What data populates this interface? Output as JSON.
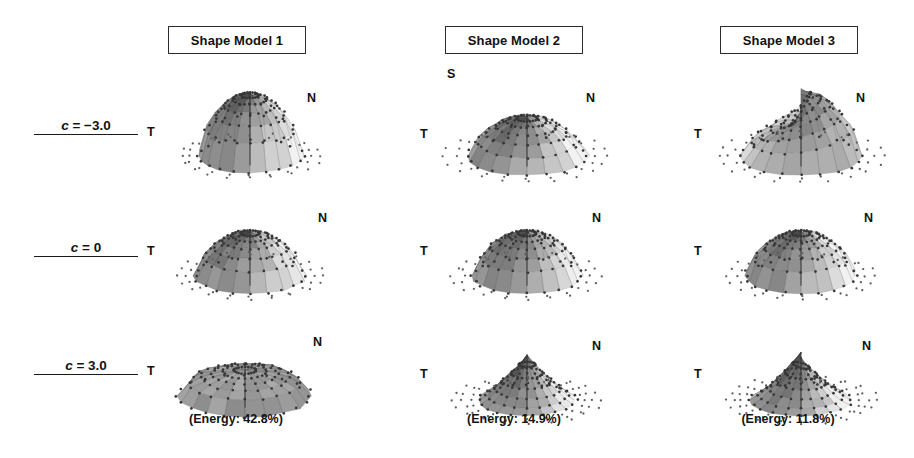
{
  "figure": {
    "background_color": "#ffffff",
    "ink_color": "#121212"
  },
  "columns": [
    {
      "header": "Shape Model 1",
      "energy": "(Energy: 42.8%)",
      "energy_value": 42.8
    },
    {
      "header": "Shape Model 2",
      "energy": "(Energy: 14.9%)",
      "energy_value": 14.9
    },
    {
      "header": "Shape Model 3",
      "energy": "(Energy: 11.8%)",
      "energy_value": 11.8
    }
  ],
  "rows": [
    {
      "label_var": "c",
      "label_rest": " = −3.0",
      "coefficient": -3.0
    },
    {
      "label_var": "c",
      "label_rest": " = 0",
      "coefficient": 0
    },
    {
      "label_var": "c",
      "label_rest": " = 3.0",
      "coefficient": 3.0
    }
  ],
  "axis_markers": {
    "north": "N",
    "temporal": "T",
    "superior": "S"
  },
  "chart_data": {
    "type": "surface-grid",
    "title": "",
    "grid_rows": 3,
    "grid_cols": 3,
    "row_variable": "c",
    "row_values": [
      -3.0,
      0,
      3.0
    ],
    "col_names": [
      "Shape Model 1",
      "Shape Model 2",
      "Shape Model 3"
    ],
    "col_energy_percent": [
      42.8,
      14.9,
      11.8
    ],
    "axis_labels": [
      "T",
      "N",
      "S"
    ],
    "panels": [
      {
        "row": 0,
        "col": 0,
        "shape": "tall-symmetric-dome",
        "height": 1.0,
        "width": 0.8,
        "tilt": 0.0,
        "note": "tall rounded dome, dark apex, symmetric"
      },
      {
        "row": 0,
        "col": 1,
        "shape": "flat-wide-dome-radial",
        "height": 0.62,
        "width": 0.92,
        "tilt": 0.0,
        "note": "flatter dome with pronounced radial fan facets; S marker at upper-left"
      },
      {
        "row": 0,
        "col": 2,
        "shape": "asymmetric-tilted-ridge",
        "height": 0.78,
        "width": 0.92,
        "tilt": 0.3,
        "note": "asymmetric, dark right flank, lighter left shelf"
      },
      {
        "row": 1,
        "col": 0,
        "shape": "mean-dome",
        "height": 0.7,
        "width": 0.84,
        "tilt": 0.0,
        "note": "mean shape"
      },
      {
        "row": 1,
        "col": 1,
        "shape": "mean-dome",
        "height": 0.7,
        "width": 0.84,
        "tilt": 0.0,
        "note": "mean shape"
      },
      {
        "row": 1,
        "col": 2,
        "shape": "mean-dome",
        "height": 0.7,
        "width": 0.84,
        "tilt": 0.0,
        "note": "mean shape"
      },
      {
        "row": 2,
        "col": 0,
        "shape": "wide-flat-ellipse",
        "height": 0.42,
        "width": 1.0,
        "tilt": 0.0,
        "note": "broad flattened disc, widest panel, light center"
      },
      {
        "row": 2,
        "col": 1,
        "shape": "narrow-peaked-cone",
        "height": 0.72,
        "width": 0.74,
        "tilt": 0.0,
        "note": "narrow peaked cone with long scattered skirt points"
      },
      {
        "row": 2,
        "col": 2,
        "shape": "narrow-peaked-cone",
        "height": 0.7,
        "width": 0.76,
        "tilt": -0.06,
        "note": "narrow peak, sparse wide skirt of markers"
      }
    ]
  }
}
